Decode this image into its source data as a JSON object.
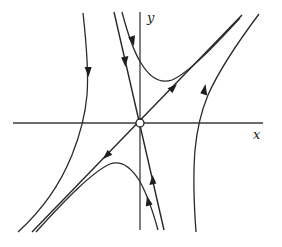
{
  "figure": {
    "type": "phase-portrait",
    "axes": {
      "x_label": "x",
      "y_label": "y"
    },
    "equilibrium": {
      "kind": "saddle",
      "marker": "open-circle",
      "position": [
        0,
        0
      ]
    },
    "manifolds": [
      {
        "name": "unstable-manifold",
        "direction": "away-from-origin",
        "slope_sign": "positive"
      },
      {
        "name": "stable-manifold",
        "direction": "toward-origin",
        "slope_sign": "negative-steep"
      }
    ],
    "trajectories": [
      {
        "name": "upper-right-trajectory",
        "direction": "downward-then-along-unstable-manifold"
      },
      {
        "name": "lower-left-trajectory",
        "direction": "upward-then-along-unstable-manifold"
      },
      {
        "name": "left-trajectory",
        "direction": "downward"
      },
      {
        "name": "right-trajectory",
        "direction": "upward"
      }
    ],
    "colors": {
      "line": "#2a2a2a",
      "background": "#ffffff"
    }
  }
}
